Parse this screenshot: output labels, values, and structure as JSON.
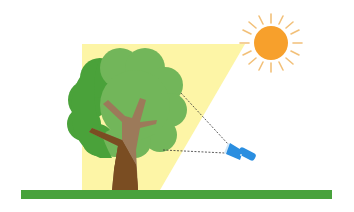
{
  "scene": {
    "title": "Sunlight and flashlight shining on a tree",
    "colors": {
      "background": "#ffffff",
      "light_cone": "#fdf5a6",
      "sun": "#f7a02c",
      "sun_rays": "#f2c079",
      "foliage_light": "#72b65a",
      "foliage_dark": "#4aa23a",
      "trunk_dark": "#7a4d22",
      "trunk_light": "#9c7a5a",
      "ground": "#48a23c",
      "flashlight": "#2a8ee0",
      "flashlight_lens": "#cfe6f7",
      "dashed_line": "#333333"
    },
    "elements": [
      "sun",
      "light-cone",
      "tree",
      "flashlight",
      "ground",
      "dashed-sight-lines"
    ]
  }
}
